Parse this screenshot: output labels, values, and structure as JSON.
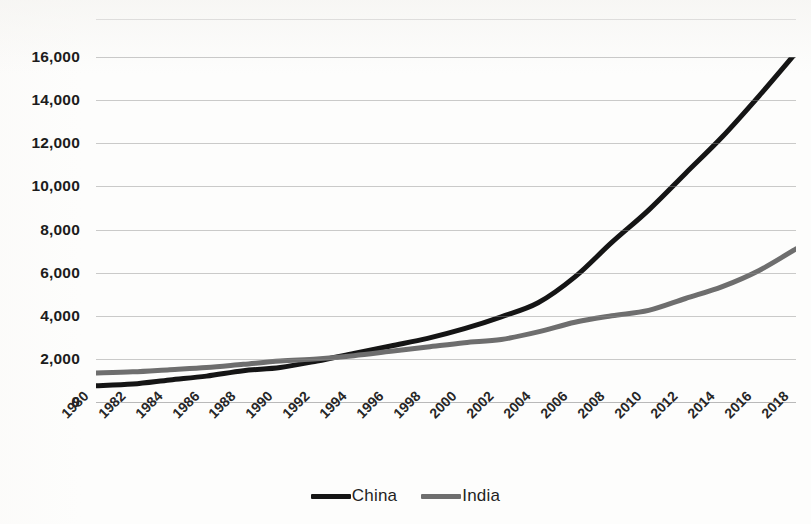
{
  "chart_data": {
    "type": "line",
    "title": "",
    "xlabel": "",
    "ylabel": "",
    "ylim": [
      0,
      16000
    ],
    "xlim": [
      1980,
      2018
    ],
    "grid": true,
    "legend_position": "bottom-center",
    "y_ticks": [
      "0",
      "2,000",
      "4,000",
      "6,000",
      "8,000",
      "10,000",
      "12,000",
      "14,000",
      "16,000"
    ],
    "y_tick_values": [
      0,
      2000,
      4000,
      6000,
      8000,
      10000,
      12000,
      14000,
      16000
    ],
    "categories": [
      "1980",
      "1982",
      "1984",
      "1986",
      "1988",
      "1990",
      "1992",
      "1994",
      "1996",
      "1998",
      "2000",
      "2002",
      "2004",
      "2006",
      "2008",
      "2010",
      "2012",
      "2014",
      "2016",
      "2018"
    ],
    "x": [
      1980,
      1982,
      1984,
      1986,
      1988,
      1990,
      1992,
      1994,
      1996,
      1998,
      2000,
      2002,
      2004,
      2006,
      2008,
      2010,
      2012,
      2014,
      2016,
      2018
    ],
    "series": [
      {
        "name": "China",
        "color": "#151515",
        "values": [
          750,
          830,
          1020,
          1200,
          1450,
          1600,
          1900,
          2250,
          2600,
          2950,
          3400,
          3950,
          4600,
          5800,
          7400,
          8900,
          10600,
          12300,
          14200,
          16200
        ]
      },
      {
        "name": "India",
        "color": "#6e6e6e",
        "values": [
          1350,
          1400,
          1500,
          1600,
          1750,
          1900,
          2000,
          2150,
          2350,
          2550,
          2750,
          2900,
          3250,
          3700,
          4000,
          4250,
          4800,
          5350,
          6100,
          7100
        ]
      }
    ]
  },
  "legend": {
    "entries": [
      {
        "label": "China",
        "color": "#151515"
      },
      {
        "label": "India",
        "color": "#6e6e6e"
      }
    ]
  }
}
